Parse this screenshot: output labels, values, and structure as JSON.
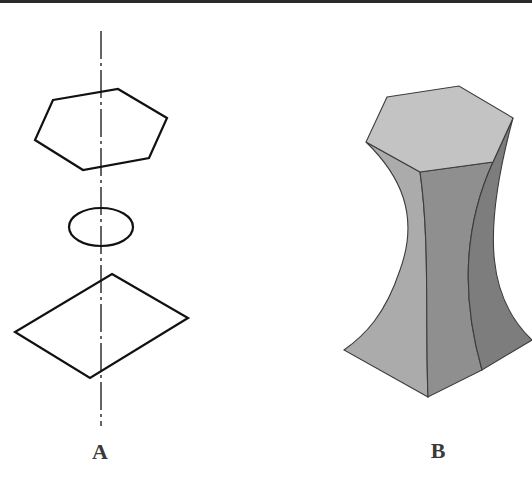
{
  "figure": {
    "top_rule_color": "#2a2a2a",
    "panels": [
      {
        "id": "A",
        "label": "A",
        "description": "Cross-sections along a vertical axis: hexagon (top), ellipse (middle), square/diamond (bottom)",
        "axis": {
          "style": "dash-dot",
          "color": "#222222"
        },
        "sections": [
          "hexagon",
          "ellipse",
          "square"
        ]
      },
      {
        "id": "B",
        "label": "B",
        "description": "Lofted solid blending a hexagonal top through a narrow waist to a square base",
        "colors": {
          "top_face": "#c3c3c3",
          "left_face": "#ababab",
          "front_face": "#8f8f8f",
          "right_face": "#7d7d7d",
          "edge": "#3c3c3c"
        }
      }
    ]
  }
}
